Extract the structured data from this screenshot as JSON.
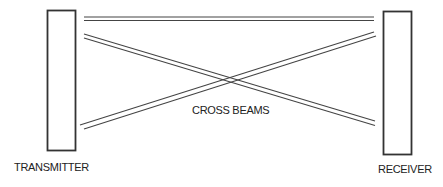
{
  "diagram": {
    "transmitter": {
      "label": "TRANSMITTER"
    },
    "receiver": {
      "label": "RECEIVER"
    },
    "beams_label": "CROSS BEAMS",
    "colors": {
      "stroke": "#333333",
      "background": "#ffffff"
    }
  }
}
